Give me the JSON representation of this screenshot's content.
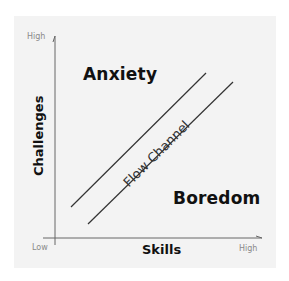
{
  "diagram": {
    "colors": {
      "background": "#ffffff",
      "panel": "#f3f3f3",
      "axis": "#666666",
      "channel_lines": "#333333",
      "labels": "#111111",
      "tick_labels": "#8a8a8a"
    },
    "y_axis": {
      "title": "Challenges",
      "high_label": "High"
    },
    "x_axis": {
      "title": "Skills",
      "low_label": "Low",
      "high_label": "High"
    },
    "regions": {
      "upper_left": "Anxiety",
      "lower_right": "Boredom"
    },
    "channel": {
      "label": "Flow Channel"
    }
  }
}
